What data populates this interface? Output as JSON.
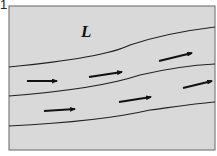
{
  "figure": {
    "number": "1",
    "region_label": "L",
    "background": "#d9d9d9",
    "frame_color": "#666666",
    "line_color": "#222222"
  },
  "streamlines": [
    {
      "name": "streamline-1",
      "d": "M9,67 C60,62 110,55 130,45 C160,35 190,30 215,27"
    },
    {
      "name": "streamline-2",
      "d": "M9,96 C60,92 110,85 140,75 C170,68 195,65 215,64"
    },
    {
      "name": "streamline-3",
      "d": "M9,126 C70,123 120,117 150,110 C180,106 200,103 215,102"
    }
  ],
  "arrows": [
    {
      "x1": 27,
      "y1": 81,
      "x2": 57,
      "y2": 81
    },
    {
      "x1": 89,
      "y1": 77,
      "x2": 122,
      "y2": 72
    },
    {
      "x1": 159,
      "y1": 61,
      "x2": 192,
      "y2": 53
    },
    {
      "x1": 44,
      "y1": 111,
      "x2": 75,
      "y2": 109
    },
    {
      "x1": 119,
      "y1": 102,
      "x2": 151,
      "y2": 97
    },
    {
      "x1": 183,
      "y1": 88,
      "x2": 212,
      "y2": 81
    }
  ]
}
